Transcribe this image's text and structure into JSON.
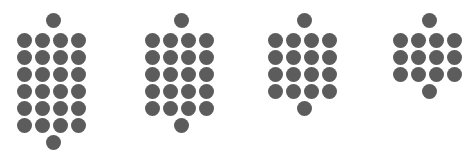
{
  "figure": {
    "title": "",
    "background_color": "#ffffff",
    "dot_color": "#5c5c5c",
    "dot_diameter": 15,
    "column_pitch": 18,
    "row_pitch": 17,
    "top_row_y": 13,
    "grid_start_y": 33
  },
  "chart_data": {
    "type": "scatter",
    "title": "",
    "subtitle": "",
    "xlabel": "",
    "ylabel": "",
    "grid": false,
    "legend_position": "none",
    "series": [
      {
        "name": "cluster-1",
        "total_dots": 26,
        "columns": 4,
        "grid_rows": 6,
        "has_top_cap_dot": true,
        "has_bottom_cap_dot": true,
        "left_x": 17,
        "cap_center_x": 53
      },
      {
        "name": "cluster-2",
        "total_dots": 22,
        "columns": 4,
        "grid_rows": 5,
        "has_top_cap_dot": true,
        "has_bottom_cap_dot": true,
        "left_x": 145,
        "cap_center_x": 181
      },
      {
        "name": "cluster-3",
        "total_dots": 18,
        "columns": 4,
        "grid_rows": 4,
        "has_top_cap_dot": true,
        "has_bottom_cap_dot": true,
        "left_x": 268,
        "cap_center_x": 304
      },
      {
        "name": "cluster-4",
        "total_dots": 14,
        "columns": 4,
        "grid_rows": 3,
        "has_top_cap_dot": true,
        "has_bottom_cap_dot": true,
        "left_x": 393,
        "cap_center_x": 429
      }
    ],
    "categories": [
      "cluster-1",
      "cluster-2",
      "cluster-3",
      "cluster-4"
    ],
    "values": [
      26,
      22,
      18,
      14
    ]
  }
}
